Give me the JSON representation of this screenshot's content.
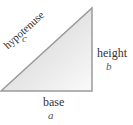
{
  "diagram": {
    "shape": "right-triangle",
    "vertices": {
      "bottom_left": [
        1,
        91
      ],
      "top_right": [
        92,
        8
      ],
      "right_angle": [
        92,
        91
      ]
    },
    "colors": {
      "fill_dark": "#d4d4d4",
      "fill_light": "#f7f7f7",
      "stroke": "#9a9a9a",
      "text": "#333333",
      "variable_text": "#555555"
    },
    "sides": {
      "hypotenuse": {
        "label": "hypotenuse",
        "variable": "c"
      },
      "height": {
        "label": "height",
        "variable": "b"
      },
      "base": {
        "label": "base",
        "variable": "a"
      }
    }
  }
}
